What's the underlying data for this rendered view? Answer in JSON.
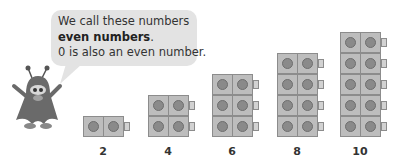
{
  "speech_bubble": {
    "line1": "We call these numbers",
    "line2_bold": "even numbers",
    "line2_suffix": ".",
    "line3": "0 is also an even number."
  },
  "character": {
    "name": "monster-mascot"
  },
  "stacks": [
    {
      "label": "2",
      "cubes": 2,
      "rows": 1
    },
    {
      "label": "4",
      "cubes": 4,
      "rows": 2
    },
    {
      "label": "6",
      "cubes": 6,
      "rows": 3
    },
    {
      "label": "8",
      "cubes": 8,
      "rows": 4
    },
    {
      "label": "10",
      "cubes": 10,
      "rows": 5
    }
  ],
  "colors": {
    "bubble": "#e3e3e3",
    "cube": "#bdbdbd",
    "cube_dot": "#8a8a8a",
    "text": "#333333"
  }
}
